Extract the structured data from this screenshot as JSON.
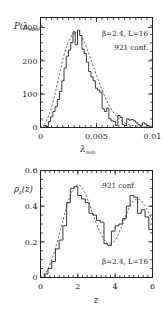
{
  "figure": {
    "name": "two-panel-lattice-qcd-distributions",
    "background": "#ffffff",
    "foreground": "#1a1a1a"
  },
  "chart_data": [
    {
      "id": "top",
      "type": "line",
      "title": "",
      "xlabel": "λ_min",
      "xlabel_base": "λ",
      "xlabel_sub": "min",
      "ylabel": "P(λ_min)",
      "ylabel_base": "P(λ",
      "ylabel_sub": "min",
      "ylabel_tail": ")",
      "xlim": [
        0,
        0.01
      ],
      "ylim": [
        0,
        330
      ],
      "xticks": [
        0,
        0.005,
        0.01
      ],
      "xticklabels": [
        "0",
        "0.005",
        "0.01"
      ],
      "yticks": [
        0,
        100,
        200,
        300
      ],
      "yticklabels": [
        "0",
        "100",
        "200",
        "300"
      ],
      "xminor_count": 20,
      "yminor_count": 13,
      "grid": false,
      "annotations": [
        {
          "text": "β=2.4, L=16",
          "x": 0.0062,
          "y": 300,
          "name": "beta-L-annotation"
        },
        {
          "text": "921 conf.",
          "x": 0.0072,
          "y": 262,
          "name": "configurations-annotation"
        }
      ],
      "series": [
        {
          "name": "histogram",
          "style": "step",
          "bin_edges": [
            0.0,
            0.0003,
            0.0005,
            0.0007,
            0.0009,
            0.0011,
            0.0013,
            0.0015,
            0.0017,
            0.0019,
            0.0021,
            0.0023,
            0.0025,
            0.0027,
            0.0029,
            0.0031,
            0.0033,
            0.0035,
            0.0037,
            0.0039,
            0.0041,
            0.0043,
            0.0045,
            0.0047,
            0.0049,
            0.0051,
            0.0053,
            0.0055,
            0.0057,
            0.0059,
            0.0061,
            0.0063,
            0.0065,
            0.0067,
            0.0069,
            0.0071,
            0.0073,
            0.0075,
            0.0077,
            0.0079,
            0.0081,
            0.0083,
            0.0085,
            0.0087,
            0.0089,
            0.0091,
            0.0093,
            0.0095,
            0.0097,
            0.01
          ],
          "values": [
            0,
            6,
            3,
            18,
            32,
            48,
            62,
            84,
            108,
            140,
            178,
            214,
            232,
            255,
            287,
            248,
            292,
            276,
            235,
            222,
            196,
            168,
            152,
            140,
            118,
            112,
            106,
            56,
            48,
            58,
            26,
            20,
            18,
            6,
            36,
            30,
            8,
            6,
            26,
            22,
            24,
            20,
            14,
            8,
            6,
            14,
            10,
            6,
            4
          ]
        },
        {
          "name": "gaussian-fit",
          "style": "dashed",
          "x": [
            0.0,
            0.0004,
            0.0008,
            0.0012,
            0.0016,
            0.002,
            0.0024,
            0.0028,
            0.0032,
            0.0036,
            0.004,
            0.0044,
            0.0048,
            0.0052,
            0.0056,
            0.006,
            0.0064,
            0.0068,
            0.0072,
            0.0076,
            0.008,
            0.0084,
            0.0088,
            0.0092,
            0.0096,
            0.01
          ],
          "y": [
            2,
            12,
            40,
            86,
            146,
            206,
            250,
            278,
            286,
            276,
            250,
            214,
            176,
            138,
            104,
            74,
            50,
            33,
            21,
            13,
            8,
            5,
            3,
            2,
            1,
            1
          ]
        }
      ]
    },
    {
      "id": "bottom",
      "type": "line",
      "title": "",
      "xlabel": "z",
      "ylabel": "ρ_s(z)",
      "ylabel_base": "ρ",
      "ylabel_sub": "s",
      "ylabel_tail": "(z)",
      "xlim": [
        0,
        6
      ],
      "ylim": [
        0,
        0.6
      ],
      "xticks": [
        0,
        2,
        4,
        6
      ],
      "xticklabels": [
        "0",
        "2",
        "4",
        "6"
      ],
      "yticks": [
        0,
        0.2,
        0.4,
        0.6
      ],
      "yticklabels": [
        "0",
        "0.2",
        "0.4",
        "0.6"
      ],
      "xminor_count": 24,
      "yminor_count": 12,
      "grid": false,
      "annotations": [
        {
          "text": "921 conf.",
          "x": 3.55,
          "y": 0.525,
          "name": "configurations-annotation"
        },
        {
          "text": "β=2.4, L=16",
          "x": 3.25,
          "y": 0.105,
          "name": "beta-L-annotation"
        }
      ],
      "series": [
        {
          "name": "histogram",
          "style": "step",
          "bin_edges": [
            0.0,
            0.2,
            0.4,
            0.6,
            0.8,
            1.0,
            1.2,
            1.4,
            1.6,
            1.8,
            2.0,
            2.2,
            2.4,
            2.6,
            2.8,
            3.0,
            3.2,
            3.4,
            3.6,
            3.8,
            4.0,
            4.2,
            4.4,
            4.6,
            4.8,
            5.0,
            5.2,
            5.4,
            5.6,
            5.8,
            6.0
          ],
          "values": [
            0.0,
            0.02,
            0.05,
            0.09,
            0.16,
            0.21,
            0.29,
            0.42,
            0.5,
            0.51,
            0.46,
            0.44,
            0.42,
            0.36,
            0.35,
            0.32,
            0.31,
            0.19,
            0.18,
            0.26,
            0.29,
            0.3,
            0.33,
            0.4,
            0.46,
            0.45,
            0.36,
            0.38,
            0.34,
            0.27
          ]
        },
        {
          "name": "random-matrix-prediction",
          "style": "dashed",
          "x": [
            0.0,
            0.2,
            0.4,
            0.6,
            0.8,
            1.0,
            1.2,
            1.4,
            1.6,
            1.8,
            2.0,
            2.2,
            2.4,
            2.6,
            2.8,
            3.0,
            3.2,
            3.4,
            3.6,
            3.8,
            4.0,
            4.2,
            4.4,
            4.6,
            4.8,
            5.0,
            5.2,
            5.4,
            5.6,
            5.8,
            6.0
          ],
          "y": [
            0.0,
            0.012,
            0.045,
            0.098,
            0.165,
            0.24,
            0.318,
            0.398,
            0.462,
            0.505,
            0.522,
            0.51,
            0.472,
            0.418,
            0.358,
            0.3,
            0.25,
            0.212,
            0.19,
            0.188,
            0.208,
            0.248,
            0.3,
            0.355,
            0.402,
            0.432,
            0.442,
            0.43,
            0.402,
            0.362,
            0.32
          ]
        }
      ]
    }
  ]
}
